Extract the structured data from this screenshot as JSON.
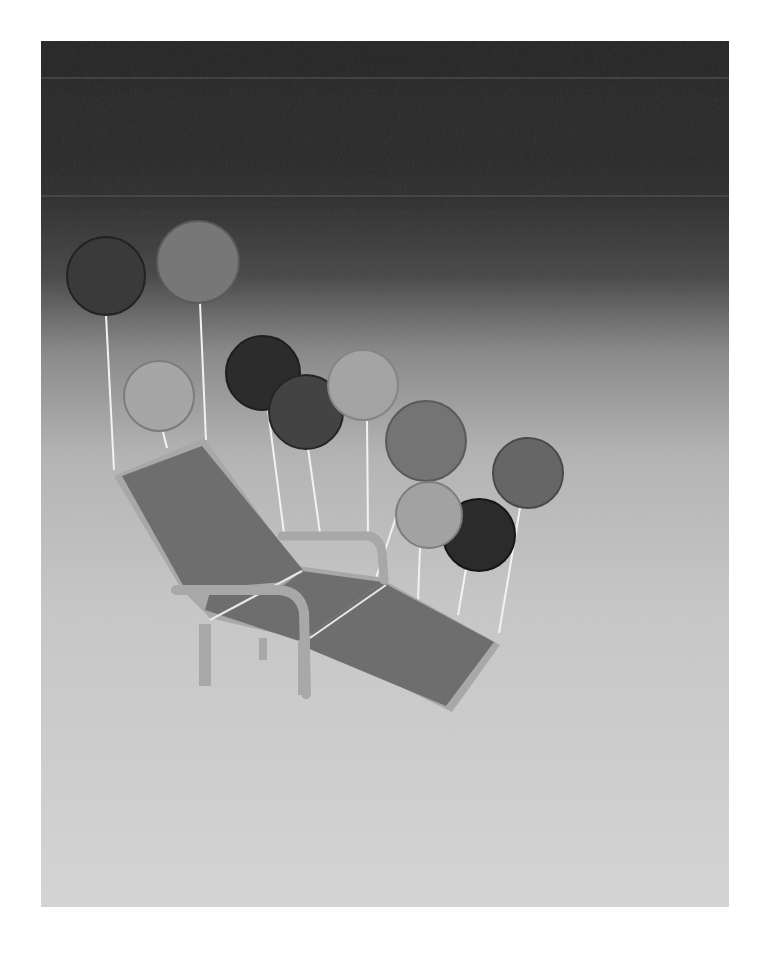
{
  "canvas": {
    "width": 771,
    "height": 958,
    "background": "#ffffff"
  },
  "painting": {
    "x": 41,
    "y": 41,
    "width": 688,
    "height": 866,
    "gradient_stops": [
      {
        "offset": 0.0,
        "color": "#2b2b2b"
      },
      {
        "offset": 0.17,
        "color": "#303030"
      },
      {
        "offset": 0.27,
        "color": "#4a4a4a"
      },
      {
        "offset": 0.36,
        "color": "#8a8a8a"
      },
      {
        "offset": 0.48,
        "color": "#b4b4b4"
      },
      {
        "offset": 0.65,
        "color": "#c6c6c6"
      },
      {
        "offset": 1.0,
        "color": "#d4d4d4"
      }
    ],
    "band_line_y": [
      78,
      196
    ]
  },
  "strings": [
    {
      "x1": 106,
      "y1": 315,
      "x2": 114,
      "y2": 470
    },
    {
      "x1": 200,
      "y1": 303,
      "x2": 206,
      "y2": 440
    },
    {
      "x1": 163,
      "y1": 432,
      "x2": 167,
      "y2": 448
    },
    {
      "x1": 268,
      "y1": 410,
      "x2": 284,
      "y2": 533
    },
    {
      "x1": 308,
      "y1": 448,
      "x2": 320,
      "y2": 533
    },
    {
      "x1": 367,
      "y1": 421,
      "x2": 368,
      "y2": 533
    },
    {
      "x1": 396,
      "y1": 517,
      "x2": 376,
      "y2": 578
    },
    {
      "x1": 420,
      "y1": 548,
      "x2": 418,
      "y2": 600
    },
    {
      "x1": 466,
      "y1": 569,
      "x2": 458,
      "y2": 615
    },
    {
      "x1": 520,
      "y1": 508,
      "x2": 499,
      "y2": 633
    }
  ],
  "balloons": [
    {
      "name": "balloon-1",
      "cx": 106,
      "cy": 276,
      "r": 39,
      "fill": "#3a3a3a",
      "stroke": "#222222"
    },
    {
      "name": "balloon-2",
      "cx": 198,
      "cy": 262,
      "r": 41,
      "fill": "#777777",
      "stroke": "#5a5a5a"
    },
    {
      "name": "balloon-3",
      "cx": 159,
      "cy": 396,
      "r": 35,
      "fill": "#a6a6a6",
      "stroke": "#7c7c7c"
    },
    {
      "name": "balloon-4",
      "cx": 263,
      "cy": 373,
      "r": 37,
      "fill": "#2c2c2c",
      "stroke": "#1e1e1e"
    },
    {
      "name": "balloon-5",
      "cx": 306,
      "cy": 412,
      "r": 37,
      "fill": "#434343",
      "stroke": "#262626"
    },
    {
      "name": "balloon-6",
      "cx": 363,
      "cy": 385,
      "r": 35,
      "fill": "#a4a4a4",
      "stroke": "#858585"
    },
    {
      "name": "balloon-7",
      "cx": 426,
      "cy": 441,
      "r": 40,
      "fill": "#747474",
      "stroke": "#5a5a5a"
    },
    {
      "name": "balloon-8",
      "cx": 528,
      "cy": 473,
      "r": 35,
      "fill": "#666666",
      "stroke": "#4a4a4a"
    },
    {
      "name": "balloon-9",
      "cx": 479,
      "cy": 535,
      "r": 36,
      "fill": "#2b2b2b",
      "stroke": "#161616"
    },
    {
      "name": "balloon-10",
      "cx": 429,
      "cy": 515,
      "r": 33,
      "fill": "#a2a2a2",
      "stroke": "#7d7d7d"
    }
  ],
  "chair": {
    "frame_color": "#a8a8a8",
    "cushion_color": "#6e6e6e",
    "seam_color": "#e8e8e8",
    "back_frame_points": "114,476 204,438 297,566 378,577 500,645 452,712 305,640 210,618 182,590",
    "back_cushion_points": "122,476 202,446 303,570 283,582 213,588 184,587",
    "seat_cushion_points": "210,592 284,585 302,571 382,582 312,633 305,643 205,610",
    "leg_cushion_points": "312,633 382,582 494,642 446,706 307,648",
    "seams": [
      {
        "x1": 210,
        "y1": 620,
        "x2": 302,
        "y2": 571
      },
      {
        "x1": 310,
        "y1": 638,
        "x2": 386,
        "y2": 585
      }
    ],
    "armrest_back_path": "M 282 536 L 368 536 Q 380 538 382 552 L 384 580",
    "armrest_front_path": "M 176 590 L 280 590 Q 300 592 304 612 L 306 694",
    "legs": [
      {
        "x": 199,
        "y": 624,
        "w": 12,
        "h": 62
      },
      {
        "x": 259,
        "y": 638,
        "w": 8,
        "h": 22
      },
      {
        "x": 298,
        "y": 640,
        "w": 12,
        "h": 55
      }
    ]
  }
}
